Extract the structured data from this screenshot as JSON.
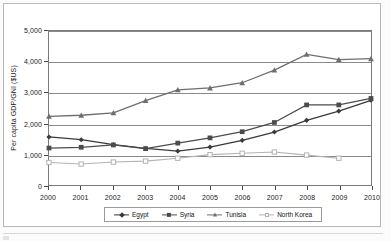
{
  "chart_data": {
    "type": "line",
    "title": "",
    "xlabel": "",
    "ylabel": "Per capita GDP/GNI ($US)",
    "categories": [
      "2000",
      "2001",
      "2002",
      "2003",
      "2004",
      "2005",
      "2006",
      "2007",
      "2008",
      "2009",
      "2010"
    ],
    "x": [
      2000,
      2001,
      2002,
      2003,
      2004,
      2005,
      2006,
      2007,
      2008,
      2009,
      2010
    ],
    "ylim": [
      0,
      5000
    ],
    "xlim": [
      2000,
      2010
    ],
    "yticks": [
      0,
      1000,
      2000,
      3000,
      4000,
      5000
    ],
    "ytick_labels": [
      "0",
      "1,000",
      "2,000",
      "3,000",
      "4,000",
      "5,000"
    ],
    "grid": true,
    "grid_axis": "y",
    "legend_position": "bottom",
    "series": [
      {
        "name": "Egypt",
        "marker": "diamond",
        "color": "#3a3a3a",
        "values": [
          1560,
          1470,
          1310,
          1190,
          1100,
          1230,
          1450,
          1720,
          2100,
          2400,
          2750
        ]
      },
      {
        "name": "Syria",
        "marker": "square",
        "color": "#4c4c4c",
        "values": [
          1200,
          1225,
          1300,
          1180,
          1360,
          1530,
          1730,
          2030,
          2600,
          2600,
          2810
        ]
      },
      {
        "name": "Tunisia",
        "marker": "triangle",
        "color": "#6e6e6e",
        "values": [
          2230,
          2265,
          2340,
          2740,
          3090,
          3150,
          3320,
          3730,
          4240,
          4070,
          4100
        ]
      },
      {
        "name": "North Korea",
        "marker": "open-square",
        "color": "#b3b3b3",
        "values": [
          730,
          680,
          745,
          775,
          870,
          985,
          1030,
          1070,
          970,
          870,
          null
        ]
      }
    ]
  },
  "legend": {
    "items": [
      {
        "label": "Egypt"
      },
      {
        "label": "Syria"
      },
      {
        "label": "Tunisia"
      },
      {
        "label": "North Korea"
      }
    ]
  },
  "colors": {
    "egypt": "#3a3a3a",
    "syria": "#4c4c4c",
    "tunisia": "#6e6e6e",
    "north_korea": "#b3b3b3",
    "axis": "#7a7a7a",
    "grid": "#8a8a8a"
  }
}
